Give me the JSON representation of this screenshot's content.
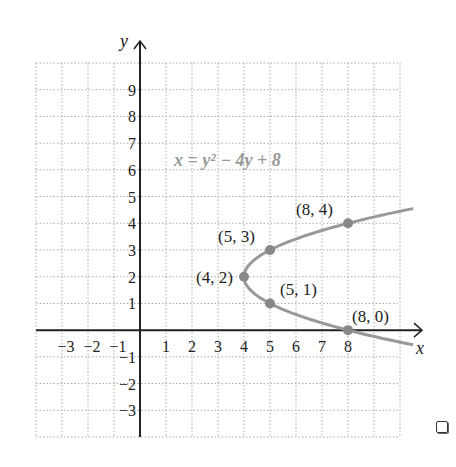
{
  "chart_data": {
    "type": "line",
    "title": "",
    "equation": "x = y² − 4y + 8",
    "xlabel": "x",
    "ylabel": "y",
    "xlim": [
      -4,
      10
    ],
    "ylim": [
      -4,
      10
    ],
    "grid": true,
    "x_ticks": [
      "−3",
      "−2",
      "−1",
      "1",
      "2",
      "3",
      "4",
      "5",
      "6",
      "7",
      "8"
    ],
    "x_tick_values": [
      -3,
      -2,
      -1,
      1,
      2,
      3,
      4,
      5,
      6,
      7,
      8
    ],
    "y_ticks": [
      "9",
      "8",
      "7",
      "6",
      "5",
      "4",
      "3",
      "2",
      "1",
      "−1",
      "−2",
      "−3"
    ],
    "y_tick_values": [
      9,
      8,
      7,
      6,
      5,
      4,
      3,
      2,
      1,
      -1,
      -2,
      -3
    ],
    "points": [
      {
        "x": 4,
        "y": 2,
        "label": "(4, 2)"
      },
      {
        "x": 5,
        "y": 3,
        "label": "(5, 3)"
      },
      {
        "x": 5,
        "y": 1,
        "label": "(5, 1)"
      },
      {
        "x": 8,
        "y": 4,
        "label": "(8, 4)"
      },
      {
        "x": 8,
        "y": 0,
        "label": "(8, 0)"
      }
    ],
    "curve_color": "#999999"
  }
}
